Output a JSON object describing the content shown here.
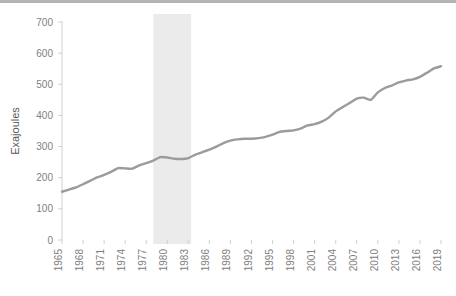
{
  "chart_data": {
    "type": "line",
    "title": "",
    "subtitle": "",
    "xlabel": "",
    "ylabel": "Exajoules",
    "ylim": [
      0,
      700
    ],
    "xlim": [
      1965,
      2019
    ],
    "ytick_step": 100,
    "xtick_step": 3,
    "grid": false,
    "legend": null,
    "legend_position": "none",
    "series_name": "Primary energy consumption",
    "line_color": "#9b9b9b",
    "line_width": 2.4,
    "axis_color": "#d0d0d0",
    "tick_label_color": "#808080",
    "axis_label_color": "#595959",
    "shaded_band": {
      "label": "",
      "x_start": 1978,
      "x_end": 1983.4,
      "color": "#ebebeb"
    },
    "yticks": [
      0,
      100,
      200,
      300,
      400,
      500,
      600,
      700
    ],
    "ytick_labels": [
      "0",
      "100",
      "200",
      "300",
      "400",
      "500",
      "600",
      "700"
    ],
    "xticks": [
      1965,
      1968,
      1971,
      1974,
      1977,
      1980,
      1983,
      1986,
      1989,
      1992,
      1995,
      1998,
      2001,
      2004,
      2007,
      2010,
      2013,
      2016,
      2019
    ],
    "xtick_labels": [
      "1965",
      "1968",
      "1971",
      "1974",
      "1977",
      "1980",
      "1983",
      "1986",
      "1989",
      "1992",
      "1995",
      "1998",
      "2001",
      "2004",
      "2007",
      "2010",
      "2013",
      "2016",
      "2019"
    ],
    "x": [
      1965,
      1966,
      1967,
      1968,
      1969,
      1970,
      1971,
      1972,
      1973,
      1974,
      1975,
      1976,
      1977,
      1978,
      1979,
      1980,
      1981,
      1982,
      1983,
      1984,
      1985,
      1986,
      1987,
      1988,
      1989,
      1990,
      1991,
      1992,
      1993,
      1994,
      1995,
      1996,
      1997,
      1998,
      1999,
      2000,
      2001,
      2002,
      2003,
      2004,
      2005,
      2006,
      2007,
      2008,
      2009,
      2010,
      2011,
      2012,
      2013,
      2014,
      2015,
      2016,
      2017,
      2018,
      2019
    ],
    "values": [
      155,
      162,
      169,
      179,
      190,
      201,
      209,
      219,
      231,
      230,
      229,
      240,
      247,
      255,
      266,
      265,
      261,
      260,
      263,
      274,
      282,
      290,
      300,
      311,
      319,
      323,
      325,
      325,
      327,
      331,
      338,
      347,
      350,
      352,
      358,
      368,
      372,
      380,
      393,
      413,
      427,
      440,
      454,
      457,
      450,
      474,
      488,
      496,
      506,
      512,
      516,
      524,
      537,
      551,
      558
    ],
    "value_unit": "Exajoules",
    "start_value": 155,
    "end_value": 558,
    "min_value": 155,
    "max_value": 558
  }
}
